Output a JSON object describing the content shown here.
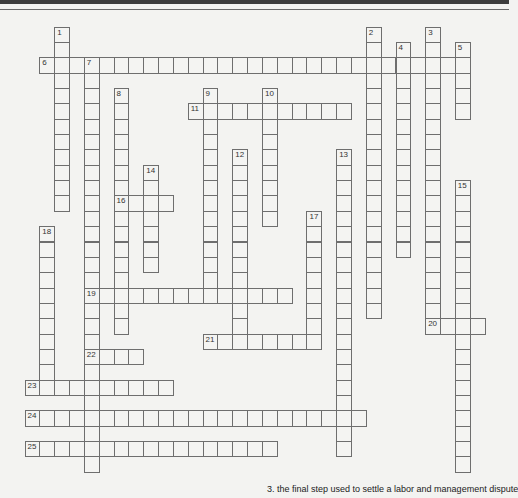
{
  "puzzle": {
    "grid": {
      "origin_x": 24.5,
      "origin_y": 26.6,
      "cell_w": 14.84,
      "cell_h": 15.35
    },
    "entries": [
      {
        "number": "1",
        "dir": "down",
        "col": 2,
        "row": 0,
        "length": 12
      },
      {
        "number": "2",
        "dir": "down",
        "col": 23,
        "row": 0,
        "length": 19
      },
      {
        "number": "3",
        "dir": "down",
        "col": 27,
        "row": 0,
        "length": 20
      },
      {
        "number": "4",
        "dir": "down",
        "col": 25,
        "row": 1,
        "length": 14
      },
      {
        "number": "5",
        "dir": "down",
        "col": 29,
        "row": 1,
        "length": 5
      },
      {
        "number": "6",
        "dir": "across",
        "col": 1,
        "row": 2,
        "length": 29
      },
      {
        "number": "7",
        "dir": "down",
        "col": 4,
        "row": 2,
        "length": 27
      },
      {
        "number": "8",
        "dir": "down",
        "col": 6,
        "row": 4,
        "length": 16
      },
      {
        "number": "9",
        "dir": "down",
        "col": 12,
        "row": 4,
        "length": 14
      },
      {
        "number": "10",
        "dir": "down",
        "col": 16,
        "row": 4,
        "length": 9
      },
      {
        "number": "11",
        "dir": "across",
        "col": 11,
        "row": 5,
        "length": 11
      },
      {
        "number": "12",
        "dir": "down",
        "col": 14,
        "row": 8,
        "length": 13
      },
      {
        "number": "13",
        "dir": "down",
        "col": 21,
        "row": 8,
        "length": 20
      },
      {
        "number": "14",
        "dir": "down",
        "col": 8,
        "row": 9,
        "length": 7
      },
      {
        "number": "15",
        "dir": "down",
        "col": 29,
        "row": 10,
        "length": 19
      },
      {
        "number": "16",
        "dir": "across",
        "col": 6,
        "row": 11,
        "length": 4
      },
      {
        "number": "17",
        "dir": "down",
        "col": 19,
        "row": 12,
        "length": 9
      },
      {
        "number": "18",
        "dir": "down",
        "col": 1,
        "row": 13,
        "length": 11
      },
      {
        "number": "19",
        "dir": "across",
        "col": 4,
        "row": 17,
        "length": 14
      },
      {
        "number": "20",
        "dir": "across",
        "col": 27,
        "row": 19,
        "length": 4
      },
      {
        "number": "21",
        "dir": "across",
        "col": 12,
        "row": 20,
        "length": 8
      },
      {
        "number": "22",
        "dir": "across",
        "col": 4,
        "row": 21,
        "length": 4
      },
      {
        "number": "23",
        "dir": "across",
        "col": 0,
        "row": 23,
        "length": 10
      },
      {
        "number": "24",
        "dir": "across",
        "col": 0,
        "row": 25,
        "length": 23
      },
      {
        "number": "25",
        "dir": "across",
        "col": 0,
        "row": 27,
        "length": 17
      }
    ]
  },
  "clues": {
    "visible_clue": "3.  the final step used to settle a labor and management dispute"
  }
}
